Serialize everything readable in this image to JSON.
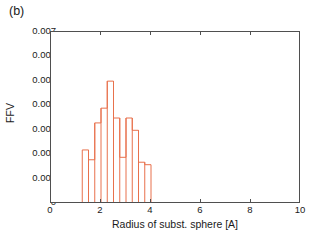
{
  "panel": {
    "label": "(b)"
  },
  "colors": {
    "bar_line": "#E8714C",
    "axis": "#4f4f4f",
    "text": "#1a1a1a",
    "background": "#ffffff"
  },
  "chart_data": {
    "type": "bar",
    "title": "",
    "subtitle": "",
    "panel_label": "(b)",
    "xlabel": "Radius of subst. sphere [A]",
    "ylabel": "FFV",
    "xlim": [
      0,
      10
    ],
    "ylim": [
      0,
      0.007
    ],
    "xticks": [
      0,
      2,
      4,
      6,
      8,
      10
    ],
    "xtick_labels": [
      "0",
      "2",
      "4",
      "6",
      "8",
      "10"
    ],
    "yticks": [
      0,
      0.001,
      0.002,
      0.003,
      0.004,
      0.005,
      0.006,
      0.007
    ],
    "ytick_labels": [
      "0",
      "0.001",
      "0.002",
      "0.003",
      "0.004",
      "0.005",
      "0.006",
      "0.007"
    ],
    "grid": false,
    "legend": null,
    "legend_position": "none",
    "bar_style": "step-outline",
    "bin_width": 0.25,
    "bin_edges": [
      1.25,
      1.5,
      1.75,
      2.0,
      2.25,
      2.5,
      2.75,
      3.0,
      3.25,
      3.5,
      3.75,
      4.0
    ],
    "bin_centers": [
      1.375,
      1.625,
      1.875,
      2.125,
      2.375,
      2.625,
      2.875,
      3.125,
      3.375,
      3.625,
      3.875
    ],
    "categories": [
      "1.375",
      "1.625",
      "1.875",
      "2.125",
      "2.375",
      "2.625",
      "2.875",
      "3.125",
      "3.375",
      "3.625",
      "3.875"
    ],
    "values": [
      0.0022,
      0.0018,
      0.0033,
      0.0039,
      0.005,
      0.0035,
      0.0019,
      0.0035,
      0.003,
      0.0017,
      0.0016
    ]
  }
}
